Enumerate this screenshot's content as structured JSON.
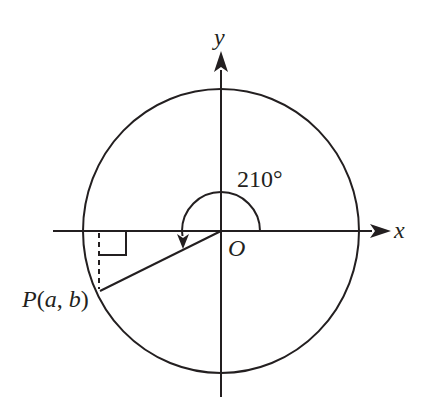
{
  "diagram": {
    "type": "unit-circle",
    "labels": {
      "y_axis": "y",
      "x_axis": "x",
      "origin": "O",
      "angle": "210°",
      "point_P": "P",
      "point_open": "(",
      "point_a": "a",
      "point_comma": ", ",
      "point_b": "b",
      "point_close": ")"
    },
    "angle_degrees": 210,
    "point": {
      "name": "P",
      "coords": "(a, b)"
    },
    "stroke_color": "#231f20",
    "background": "#ffffff"
  }
}
